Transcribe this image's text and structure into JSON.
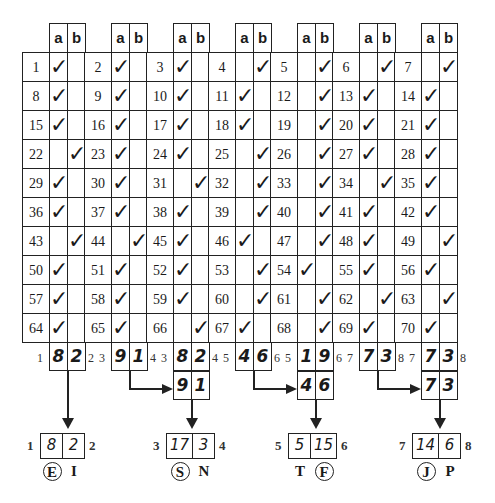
{
  "grid": {
    "column_headers": [
      "a",
      "b"
    ],
    "rows": [
      [
        {
          "n": "1",
          "c": "a"
        },
        {
          "n": "2",
          "c": "a"
        },
        {
          "n": "3",
          "c": "a"
        },
        {
          "n": "4",
          "c": "b"
        },
        {
          "n": "5",
          "c": "b"
        },
        {
          "n": "6",
          "c": "b"
        },
        {
          "n": "7",
          "c": "b"
        }
      ],
      [
        {
          "n": "8",
          "c": "a"
        },
        {
          "n": "9",
          "c": "a"
        },
        {
          "n": "10",
          "c": "a"
        },
        {
          "n": "11",
          "c": "a"
        },
        {
          "n": "12",
          "c": "b"
        },
        {
          "n": "13",
          "c": "a"
        },
        {
          "n": "14",
          "c": "a"
        }
      ],
      [
        {
          "n": "15",
          "c": "a"
        },
        {
          "n": "16",
          "c": "a"
        },
        {
          "n": "17",
          "c": "a"
        },
        {
          "n": "18",
          "c": "a"
        },
        {
          "n": "19",
          "c": "b"
        },
        {
          "n": "20",
          "c": "a"
        },
        {
          "n": "21",
          "c": "a"
        }
      ],
      [
        {
          "n": "22",
          "c": "b"
        },
        {
          "n": "23",
          "c": "a"
        },
        {
          "n": "24",
          "c": "a"
        },
        {
          "n": "25",
          "c": "b"
        },
        {
          "n": "26",
          "c": "b"
        },
        {
          "n": "27",
          "c": "a"
        },
        {
          "n": "28",
          "c": "a"
        }
      ],
      [
        {
          "n": "29",
          "c": "a"
        },
        {
          "n": "30",
          "c": "a"
        },
        {
          "n": "31",
          "c": "b"
        },
        {
          "n": "32",
          "c": "b"
        },
        {
          "n": "33",
          "c": "b"
        },
        {
          "n": "34",
          "c": "b"
        },
        {
          "n": "35",
          "c": "a"
        }
      ],
      [
        {
          "n": "36",
          "c": "a"
        },
        {
          "n": "37",
          "c": "a"
        },
        {
          "n": "38",
          "c": "a"
        },
        {
          "n": "39",
          "c": "b"
        },
        {
          "n": "40",
          "c": "b"
        },
        {
          "n": "41",
          "c": "a"
        },
        {
          "n": "42",
          "c": "a"
        }
      ],
      [
        {
          "n": "43",
          "c": "b"
        },
        {
          "n": "44",
          "c": "b"
        },
        {
          "n": "45",
          "c": "a"
        },
        {
          "n": "46",
          "c": "a"
        },
        {
          "n": "47",
          "c": "b"
        },
        {
          "n": "48",
          "c": "a"
        },
        {
          "n": "49",
          "c": "b"
        }
      ],
      [
        {
          "n": "50",
          "c": "a"
        },
        {
          "n": "51",
          "c": "a"
        },
        {
          "n": "52",
          "c": "a"
        },
        {
          "n": "53",
          "c": "b"
        },
        {
          "n": "54",
          "c": "a"
        },
        {
          "n": "55",
          "c": "a"
        },
        {
          "n": "56",
          "c": "a"
        }
      ],
      [
        {
          "n": "57",
          "c": "a"
        },
        {
          "n": "58",
          "c": "a"
        },
        {
          "n": "59",
          "c": "a"
        },
        {
          "n": "60",
          "c": "b"
        },
        {
          "n": "61",
          "c": "b"
        },
        {
          "n": "62",
          "c": "b"
        },
        {
          "n": "63",
          "c": "b"
        }
      ],
      [
        {
          "n": "64",
          "c": "a"
        },
        {
          "n": "65",
          "c": "a"
        },
        {
          "n": "66",
          "c": "b"
        },
        {
          "n": "67",
          "c": "a"
        },
        {
          "n": "68",
          "c": "b"
        },
        {
          "n": "69",
          "c": "a"
        },
        {
          "n": "70",
          "c": "a"
        }
      ]
    ],
    "check_glyph": "✓"
  },
  "column_totals": [
    {
      "left_label": "1",
      "a": "8",
      "b": "2",
      "right_label": "2"
    },
    {
      "left_label": "3",
      "a": "9",
      "b": "1",
      "right_label": "4"
    },
    {
      "left_label": "3",
      "a": "8",
      "b": "2",
      "right_label": "4"
    },
    {
      "left_label": "5",
      "a": "4",
      "b": "6",
      "right_label": "6"
    },
    {
      "left_label": "5",
      "a": "1",
      "b": "9",
      "right_label": "6"
    },
    {
      "left_label": "7",
      "a": "7",
      "b": "3",
      "right_label": "8"
    },
    {
      "left_label": "7",
      "a": "7",
      "b": "3",
      "right_label": "8"
    }
  ],
  "carried_totals": [
    {
      "a": "9",
      "b": "1"
    },
    {
      "a": "4",
      "b": "6"
    },
    {
      "a": "7",
      "b": "3"
    }
  ],
  "results": [
    {
      "left_label": "1",
      "a": "8",
      "b": "2",
      "right_label": "2",
      "letter_a": "E",
      "letter_b": "I",
      "chosen": "a"
    },
    {
      "left_label": "3",
      "a": "17",
      "b": "3",
      "right_label": "4",
      "letter_a": "S",
      "letter_b": "N",
      "chosen": "a"
    },
    {
      "left_label": "5",
      "a": "5",
      "b": "15",
      "right_label": "6",
      "letter_a": "T",
      "letter_b": "F",
      "chosen": "b"
    },
    {
      "left_label": "7",
      "a": "14",
      "b": "6",
      "right_label": "8",
      "letter_a": "J",
      "letter_b": "P",
      "chosen": "a"
    }
  ]
}
